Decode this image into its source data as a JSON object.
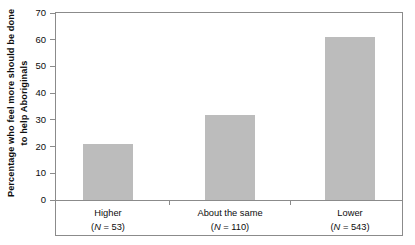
{
  "chart_data": {
    "type": "bar",
    "title": "",
    "xlabel": "",
    "ylabel_line1": "Percentage who feel more should be done",
    "ylabel_line2": "to help Aboriginals",
    "categories": [
      "Higher",
      "About the same",
      "Lower"
    ],
    "values": [
      21,
      32,
      61
    ],
    "counts": [
      53,
      110,
      543
    ],
    "count_labels": [
      "(N = 53)",
      "(N = 110)",
      "(N = 543)"
    ],
    "ylim": [
      0,
      70
    ],
    "yticks": [
      0,
      10,
      20,
      30,
      40,
      50,
      60,
      70
    ],
    "ytick_labels": [
      "0",
      "10",
      "20",
      "30",
      "40",
      "50",
      "60",
      "70"
    ],
    "grid": false,
    "legend": "none",
    "bar_color": "#bcbcbc",
    "axis_color": "#8b8b8b",
    "text_color": "#0d0d0d"
  }
}
